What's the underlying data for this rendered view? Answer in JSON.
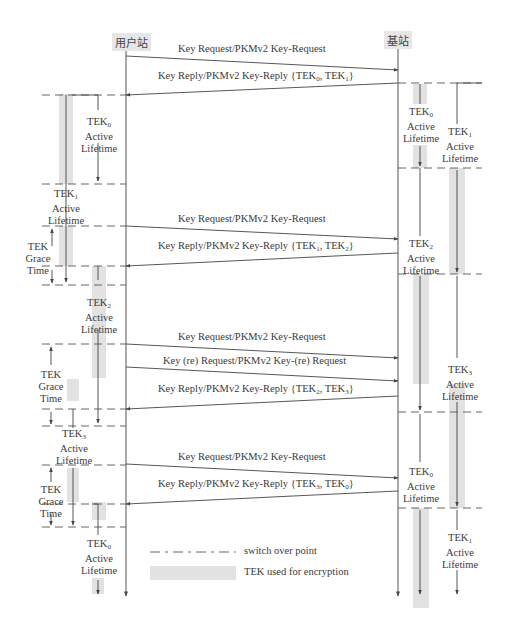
{
  "actors": {
    "subscriber": "用户站",
    "base_station": "基站"
  },
  "messages": [
    {
      "id": "m1",
      "text": "Key Request/PKMv2 Key-Request",
      "dir": "right"
    },
    {
      "id": "m2",
      "text_prefix": "Key Reply/PKMv2 Key-Reply {TEK",
      "k1": "0",
      "mid": ", TEK",
      "k2": "1",
      "suffix": "}",
      "dir": "left"
    },
    {
      "id": "m3",
      "text": "Key Request/PKMv2 Key-Request",
      "dir": "right"
    },
    {
      "id": "m4",
      "text_prefix": "Key Reply/PKMv2 Key-Reply {TEK",
      "k1": "1",
      "mid": ", TEK",
      "k2": "2",
      "suffix": "}",
      "dir": "left"
    },
    {
      "id": "m5",
      "text": "Key Request/PKMv2 Key-Request",
      "dir": "right"
    },
    {
      "id": "m6",
      "text": "Key (re) Request/PKMv2 Key-(re) Request",
      "dir": "right"
    },
    {
      "id": "m7",
      "text_prefix": "Key Reply/PKMv2 Key-Reply {TEK",
      "k1": "2",
      "mid": ", TEK",
      "k2": "3",
      "suffix": "}",
      "dir": "left"
    },
    {
      "id": "m8",
      "text": "Key Request/PKMv2 Key-Request",
      "dir": "right"
    },
    {
      "id": "m9",
      "text_prefix": "Key Reply/PKMv2 Key-Reply {TEK",
      "k1": "3",
      "mid": ", TEK",
      "k2": "0",
      "suffix": "}",
      "dir": "left"
    }
  ],
  "ss_labels": [
    {
      "tek": "TEK",
      "n": "0",
      "l2": "Active",
      "l3": "Lifetime"
    },
    {
      "tek": "TEK",
      "n": "1",
      "l2": "Active",
      "l3": "Lifetime"
    },
    {
      "tek": "TEK",
      "n": "2",
      "l2": "Active",
      "l3": "Lifetime"
    },
    {
      "tek": "TEK",
      "n": "3",
      "l2": "Active",
      "l3": "Lifetime"
    },
    {
      "tek": "TEK",
      "n": "0",
      "l2": "Active",
      "l3": "Lifetime"
    }
  ],
  "grace_labels": [
    {
      "l1": "TEK",
      "l2": "Grace",
      "l3": "Time"
    },
    {
      "l1": "TEK",
      "l2": "Grace",
      "l3": "Time"
    },
    {
      "l1": "TEK",
      "l2": "Grace",
      "l3": "Time"
    }
  ],
  "bs_labels": [
    {
      "tek": "TEK",
      "n": "0",
      "l2": "Active",
      "l3": "Lifetime"
    },
    {
      "tek": "TEK",
      "n": "1",
      "l2": "Active",
      "l3": "Lifetime"
    },
    {
      "tek": "TEK",
      "n": "2",
      "l2": "Active",
      "l3": "Lifetime"
    },
    {
      "tek": "TEK",
      "n": "3",
      "l2": "Active",
      "l3": "Lifetime"
    },
    {
      "tek": "TEK",
      "n": "0",
      "l2": "Active",
      "l3": "Lifetime"
    },
    {
      "tek": "TEK",
      "n": "1",
      "l2": "Active",
      "l3": "Lifetime"
    }
  ],
  "legend": {
    "switch_over": "switch over point",
    "encryption": "TEK used for encryption"
  },
  "colors": {
    "line": "#555555",
    "shade": "#e2e2e2",
    "actor_bg": "#e6e6e6"
  }
}
